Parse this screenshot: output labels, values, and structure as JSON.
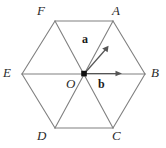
{
  "figure": {
    "background_color": "#ffffff",
    "edge_color": "#808080",
    "label_color": "#2b2b2b",
    "vector_color": "#555555",
    "center_dot_color": "#111111",
    "shape": "regular hexagon with all three main diagonals drawn through the centre"
  },
  "vertices": [
    {
      "id": "F",
      "label": "F",
      "cx": 55,
      "cy": 21,
      "label_x": 37,
      "label_y": 4
    },
    {
      "id": "A",
      "label": "A",
      "cx": 113,
      "cy": 21,
      "label_x": 112,
      "label_y": 4
    },
    {
      "id": "B",
      "label": "B",
      "cx": 145,
      "cy": 74,
      "label_x": 151,
      "label_y": 66
    },
    {
      "id": "C",
      "label": "C",
      "cx": 113,
      "cy": 128,
      "label_x": 112,
      "label_y": 129
    },
    {
      "id": "D",
      "label": "D",
      "cx": 55,
      "cy": 128,
      "label_x": 37,
      "label_y": 129
    },
    {
      "id": "E",
      "label": "E",
      "cx": 22,
      "cy": 74,
      "label_x": 3,
      "label_y": 66
    }
  ],
  "center": {
    "id": "O",
    "label": "O",
    "cx": 84,
    "cy": 74,
    "label_x": 66,
    "label_y": 77,
    "marker": "filled-dot"
  },
  "vectors": [
    {
      "id": "a",
      "label": "a",
      "from": "O",
      "to": "A",
      "tip_x": 107,
      "tip_y": 48,
      "label_x": 82,
      "label_y": 33,
      "description": "vector a from centre O pointing toward vertex A (up and to the right)"
    },
    {
      "id": "b",
      "label": "b",
      "from": "O",
      "to": "B",
      "tip_x": 121,
      "tip_y": 74,
      "label_x": 98,
      "label_y": 78,
      "description": "vector b from centre O pointing toward vertex B (horizontally right)"
    }
  ],
  "edges": [
    {
      "from": "F",
      "to": "A"
    },
    {
      "from": "A",
      "to": "B"
    },
    {
      "from": "B",
      "to": "C"
    },
    {
      "from": "C",
      "to": "D"
    },
    {
      "from": "D",
      "to": "E"
    },
    {
      "from": "E",
      "to": "F"
    }
  ],
  "diagonals": [
    {
      "from": "A",
      "to": "D"
    },
    {
      "from": "B",
      "to": "E"
    },
    {
      "from": "C",
      "to": "F"
    }
  ]
}
